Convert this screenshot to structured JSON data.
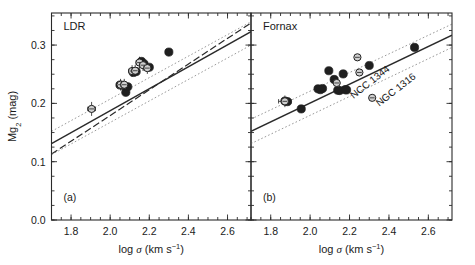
{
  "figure": {
    "width": 475,
    "height": 265,
    "background": "#ffffff",
    "ink_color": "#1a1a1a",
    "line_color": "#2a2a2a",
    "dotted_color": "#9a9a9a",
    "point_fill": "#1f1f1f",
    "point_open_fill": "#cfcfcf"
  },
  "chart_data": [
    {
      "type": "scatter",
      "panel_tag": "(a)",
      "title": "LDR",
      "xlabel": "log σ (km s⁻¹)",
      "ylabel": "Mg₂ (mag)",
      "xlim": [
        1.7,
        2.72
      ],
      "ylim": [
        0.0,
        0.355
      ],
      "xticks": [
        1.8,
        2.0,
        2.2,
        2.4,
        2.6
      ],
      "xticklabels": [
        "1.8",
        "2.0",
        "2.2",
        "2.4",
        "2.6"
      ],
      "yticks": [
        0.0,
        0.1,
        0.2,
        0.3
      ],
      "yticklabels": [
        "0.0",
        "0.1",
        "0.2",
        "0.3"
      ],
      "xminor_step": 0.05,
      "yminor_step": 0.025,
      "grid": false,
      "legend": "none",
      "series": [
        {
          "name": "filled circles",
          "marker": "filled-circle",
          "points": [
            {
              "x": 2.05,
              "y": 0.2315
            },
            {
              "x": 2.063,
              "y": 0.231
            },
            {
              "x": 2.08,
              "y": 0.219
            },
            {
              "x": 2.09,
              "y": 0.2285
            },
            {
              "x": 2.118,
              "y": 0.253
            },
            {
              "x": 2.133,
              "y": 0.2545
            },
            {
              "x": 2.16,
              "y": 0.272
            },
            {
              "x": 2.173,
              "y": 0.268
            },
            {
              "x": 2.2,
              "y": 0.262
            },
            {
              "x": 2.3,
              "y": 0.288
            }
          ]
        },
        {
          "name": "open circles with error bars",
          "marker": "open-circle",
          "points": [
            {
              "x": 1.905,
              "y": 0.1905,
              "xerr": 0.02,
              "yerr": 0.012
            },
            {
              "x": 2.053,
              "y": 0.232,
              "xerr": 0.018,
              "yerr": 0.01
            },
            {
              "x": 2.072,
              "y": 0.232,
              "xerr": 0.018,
              "yerr": 0.01
            },
            {
              "x": 2.112,
              "y": 0.2555,
              "xerr": 0.018,
              "yerr": 0.01
            },
            {
              "x": 2.128,
              "y": 0.256,
              "xerr": 0.018,
              "yerr": 0.01
            },
            {
              "x": 2.15,
              "y": 0.27,
              "xerr": 0.018,
              "yerr": 0.01
            },
            {
              "x": 2.168,
              "y": 0.2655,
              "xerr": 0.018,
              "yerr": 0.01
            },
            {
              "x": 2.19,
              "y": 0.2605,
              "xerr": 0.018,
              "yerr": 0.01
            }
          ]
        }
      ],
      "lines": [
        {
          "name": "best-fit",
          "style": "solid",
          "x0": 1.7,
          "y0": 0.131,
          "x1": 2.72,
          "y1": 0.323
        },
        {
          "name": "comparison-fit",
          "style": "dashed",
          "x0": 1.7,
          "y0": 0.113,
          "x1": 2.72,
          "y1": 0.338
        },
        {
          "name": "upper-envelope",
          "style": "dotted",
          "x0": 1.7,
          "y0": 0.152,
          "x1": 2.72,
          "y1": 0.34
        },
        {
          "name": "lower-envelope",
          "style": "dotted",
          "x0": 1.7,
          "y0": 0.112,
          "x1": 2.72,
          "y1": 0.3
        }
      ],
      "annotations": []
    },
    {
      "type": "scatter",
      "panel_tag": "(b)",
      "title": "Fornax",
      "xlabel": "log σ (km s⁻¹)",
      "ylabel": "",
      "xlim": [
        1.7,
        2.72
      ],
      "ylim": [
        0.0,
        0.355
      ],
      "xticks": [
        1.8,
        2.0,
        2.2,
        2.4,
        2.6
      ],
      "xticklabels": [
        "1.8",
        "2.0",
        "2.2",
        "2.4",
        "2.6"
      ],
      "yticks": [
        0.0,
        0.1,
        0.2,
        0.3
      ],
      "yticklabels": [],
      "xminor_step": 0.05,
      "yminor_step": 0.025,
      "grid": false,
      "legend": "none",
      "series": [
        {
          "name": "filled circles",
          "marker": "filled-circle",
          "points": [
            {
              "x": 1.872,
              "y": 0.204
            },
            {
              "x": 1.885,
              "y": 0.203
            },
            {
              "x": 1.955,
              "y": 0.1905
            },
            {
              "x": 2.04,
              "y": 0.225
            },
            {
              "x": 2.052,
              "y": 0.2235
            },
            {
              "x": 2.063,
              "y": 0.2255
            },
            {
              "x": 2.095,
              "y": 0.256
            },
            {
              "x": 2.122,
              "y": 0.241
            },
            {
              "x": 2.14,
              "y": 0.2225
            },
            {
              "x": 2.15,
              "y": 0.222
            },
            {
              "x": 2.168,
              "y": 0.2505
            },
            {
              "x": 2.178,
              "y": 0.2235
            },
            {
              "x": 2.185,
              "y": 0.223
            },
            {
              "x": 2.3,
              "y": 0.265
            },
            {
              "x": 2.53,
              "y": 0.296
            }
          ]
        },
        {
          "name": "open circles",
          "marker": "open-circle",
          "points": [
            {
              "x": 1.872,
              "y": 0.2035,
              "xerr": 0.032,
              "yerr": 0.01
            },
            {
              "x": 2.135,
              "y": 0.235,
              "xerr": 0.0,
              "yerr": 0.0
            },
            {
              "x": 2.24,
              "y": 0.279,
              "xerr": 0.0,
              "yerr": 0.0
            },
            {
              "x": 2.25,
              "y": 0.253,
              "xerr": 0.0,
              "yerr": 0.0
            },
            {
              "x": 2.315,
              "y": 0.2095,
              "xerr": 0.0,
              "yerr": 0.0
            }
          ]
        }
      ],
      "lines": [
        {
          "name": "best-fit",
          "style": "solid",
          "x0": 1.7,
          "y0": 0.152,
          "x1": 2.72,
          "y1": 0.317
        },
        {
          "name": "upper-envelope",
          "style": "dotted",
          "x0": 1.7,
          "y0": 0.173,
          "x1": 2.72,
          "y1": 0.336
        },
        {
          "name": "lower-envelope",
          "style": "dotted",
          "x0": 1.7,
          "y0": 0.131,
          "x1": 2.72,
          "y1": 0.296
        }
      ],
      "annotations": [
        {
          "text": "NGC 1316",
          "target_x": 2.315,
          "target_y": 0.2095,
          "angle": -38
        },
        {
          "text": "NCC 1344",
          "target_x": 2.185,
          "target_y": 0.223,
          "angle": -38
        }
      ]
    }
  ]
}
